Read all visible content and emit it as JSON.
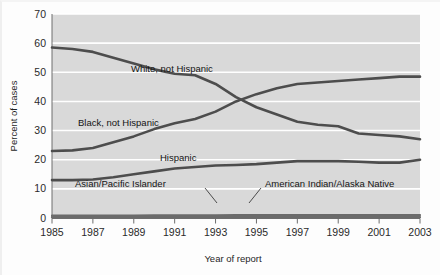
{
  "figure": {
    "title": "",
    "background_color": "#fdfdfd",
    "plot_background_color": "#d9d9d9",
    "gridline_color": "#ffffff",
    "line_color": "#4d4d4d"
  },
  "axes": {
    "y_title": "Percent of cases",
    "x_title": "Year of report",
    "y_ticks": [
      "0",
      "10",
      "20",
      "30",
      "40",
      "50",
      "60",
      "70"
    ],
    "x_ticks": [
      "1985",
      "1987",
      "1989",
      "1991",
      "1993",
      "1995",
      "1997",
      "1999",
      "2001",
      "2003"
    ]
  },
  "annotations": [
    {
      "name": "white-not-hispanic-label",
      "text": "White, not Hispanic"
    },
    {
      "name": "black-not-hispanic-label",
      "text": "Black, not Hispanic"
    },
    {
      "name": "hispanic-label",
      "text": "Hispanic"
    },
    {
      "name": "asian-pacific-islander-label",
      "text": "Asian/Pacific Islander"
    },
    {
      "name": "american-indian-alaska-native-label",
      "text": "American Indian/Alaska Native"
    }
  ],
  "chart_data": {
    "type": "line",
    "title": "",
    "subtitle": "",
    "xlabel": "Year of report",
    "ylabel": "Percent of cases",
    "xlim": [
      1985,
      2003
    ],
    "ylim": [
      0,
      70
    ],
    "ytick_step": 10,
    "xtick_step": 2,
    "grid": true,
    "grid_axis": "y",
    "legend": "inline-annotations",
    "legend_position": "none",
    "x": [
      1985,
      1986,
      1987,
      1988,
      1989,
      1990,
      1991,
      1992,
      1993,
      1994,
      1995,
      1996,
      1997,
      1998,
      1999,
      2000,
      2001,
      2002,
      2003
    ],
    "series": [
      {
        "name": "White, not Hispanic",
        "label": "White, not Hispanic",
        "values": [
          58.5,
          58.0,
          57.0,
          55.0,
          53.0,
          51.0,
          49.5,
          49.0,
          46.0,
          41.5,
          38.0,
          35.5,
          33.0,
          32.0,
          31.5,
          29.0,
          28.5,
          28.0,
          27.0
        ]
      },
      {
        "name": "Black, not Hispanic",
        "label": "Black, not Hispanic",
        "values": [
          23.0,
          23.2,
          24.0,
          26.0,
          28.0,
          30.5,
          32.5,
          34.0,
          36.5,
          40.0,
          42.5,
          44.5,
          46.0,
          46.5,
          47.0,
          47.5,
          48.0,
          48.5,
          48.5
        ]
      },
      {
        "name": "Hispanic",
        "label": "Hispanic",
        "values": [
          13.0,
          13.0,
          13.2,
          14.0,
          15.0,
          16.0,
          17.0,
          17.5,
          18.0,
          18.2,
          18.5,
          19.0,
          19.5,
          19.5,
          19.5,
          19.3,
          19.0,
          19.0,
          20.0
        ]
      },
      {
        "name": "Asian/Pacific Islander",
        "label": "Asian/Pacific Islander",
        "values": [
          0.8,
          0.8,
          0.8,
          0.8,
          0.8,
          0.9,
          0.9,
          0.9,
          0.9,
          1.0,
          1.0,
          1.0,
          1.0,
          1.0,
          1.0,
          1.0,
          1.0,
          1.0,
          1.0
        ]
      },
      {
        "name": "American Indian/Alaska Native",
        "label": "American Indian/Alaska Native",
        "values": [
          0.3,
          0.3,
          0.3,
          0.3,
          0.3,
          0.3,
          0.3,
          0.3,
          0.3,
          0.3,
          0.3,
          0.3,
          0.3,
          0.3,
          0.3,
          0.3,
          0.3,
          0.3,
          0.3
        ]
      }
    ]
  }
}
